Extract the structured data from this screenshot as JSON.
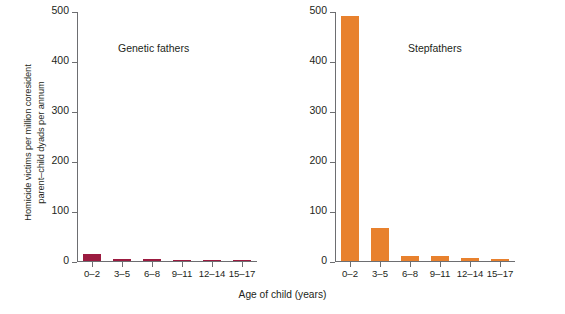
{
  "chart_data": {
    "type": "bar",
    "title": "",
    "xlabel": "Age of child (years)",
    "ylabel": "Homicide victims per million coresident\nparent–child dyads per annum",
    "categories": [
      "0–2",
      "3–5",
      "6–8",
      "9–11",
      "12–14",
      "15–17"
    ],
    "ylim": [
      0,
      500
    ],
    "yticks": [
      0,
      100,
      200,
      300,
      400,
      500
    ],
    "ytick_labels": [
      "0",
      "100",
      "200",
      "300",
      "400",
      "500"
    ],
    "grid": false,
    "legend": "none",
    "panels": [
      {
        "name": "genetic-fathers",
        "title": "Genetic fathers",
        "color": "#9B1B40",
        "values": [
          14,
          5,
          4,
          3,
          3,
          2
        ]
      },
      {
        "name": "stepfathers",
        "title": "Stepfathers",
        "color": "#E8812E",
        "values": [
          490,
          67,
          10,
          10,
          6,
          5
        ]
      }
    ],
    "series": [
      {
        "name": "Genetic fathers",
        "values": [
          14,
          5,
          4,
          3,
          3,
          2
        ]
      },
      {
        "name": "Stepfathers",
        "values": [
          490,
          67,
          10,
          10,
          6,
          5
        ]
      }
    ]
  },
  "colors": {
    "genetic_fathers_bar": "#9B1B40",
    "stepfathers_bar": "#E8812E",
    "axis": "#6D6E71",
    "text": "#231F20",
    "background": "#FFFFFF"
  }
}
